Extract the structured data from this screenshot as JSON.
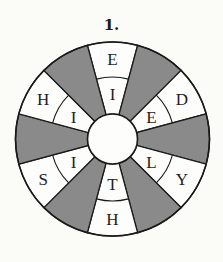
{
  "title": "1.",
  "wheel": {
    "center": [
      112.5,
      139
    ],
    "outer_radius": 97,
    "middle_radius": 62,
    "inner_radius": 25,
    "colors": {
      "white": "#fdfdfb",
      "gray": "#8a8a8a",
      "stroke": "#1a1a1a"
    },
    "segments": [
      {
        "angle": 90,
        "color": "white",
        "outer": "E",
        "inner": "I"
      },
      {
        "angle": 60,
        "color": "gray"
      },
      {
        "angle": 30,
        "color": "white",
        "outer": "D",
        "inner": "E"
      },
      {
        "angle": 0,
        "color": "gray"
      },
      {
        "angle": -30,
        "color": "white",
        "outer": "Y",
        "inner": "L"
      },
      {
        "angle": -60,
        "color": "gray"
      },
      {
        "angle": -90,
        "color": "white",
        "outer": "H",
        "inner": "T"
      },
      {
        "angle": -120,
        "color": "gray"
      },
      {
        "angle": -150,
        "color": "white",
        "outer": "S",
        "inner": "I"
      },
      {
        "angle": 180,
        "color": "gray"
      },
      {
        "angle": 150,
        "color": "white",
        "outer": "H",
        "inner": "I"
      },
      {
        "angle": 120,
        "color": "gray"
      }
    ]
  }
}
